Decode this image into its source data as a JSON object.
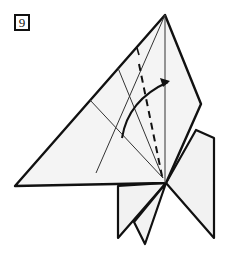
{
  "step": {
    "number": "9"
  },
  "diagram": {
    "colors": {
      "paper": "#f2f2f2",
      "outline": "#111111",
      "crease": "#333333"
    }
  }
}
